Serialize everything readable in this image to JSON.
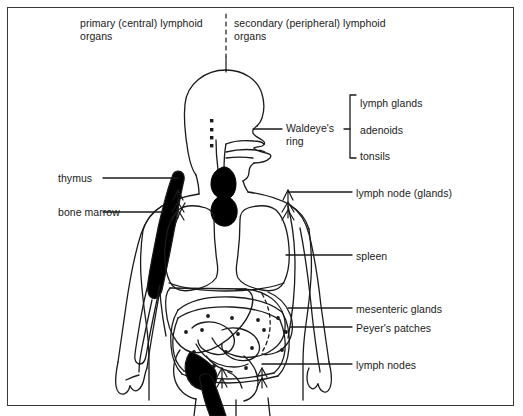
{
  "diagram": {
    "headers": {
      "left": "primary (central) lymphoid organs",
      "right": "secondary (peripheral) lymphoid organs"
    },
    "labels_right": [
      {
        "id": "waldeyer",
        "text": "Waldeye's ring"
      },
      {
        "id": "lymph_glands",
        "text": "lymph glands"
      },
      {
        "id": "adenoids",
        "text": "adenoids"
      },
      {
        "id": "tonsils",
        "text": "tonsils"
      },
      {
        "id": "lymph_node_glands",
        "text": "lymph node (glands)"
      },
      {
        "id": "spleen",
        "text": "spleen"
      },
      {
        "id": "mesenteric_glands",
        "text": "mesenteric glands"
      },
      {
        "id": "peyers_patches",
        "text": "Peyer's patches"
      },
      {
        "id": "lymph_nodes",
        "text": "lymph nodes"
      }
    ],
    "labels_left": [
      {
        "id": "thymus",
        "text": "thymus"
      },
      {
        "id": "bone_marrow",
        "text": "bone marrow"
      }
    ],
    "colors": {
      "ink": "#1a1a1a",
      "border": "#3a3a3a",
      "fill_solid": "#000000",
      "background": "#ffffff"
    }
  }
}
